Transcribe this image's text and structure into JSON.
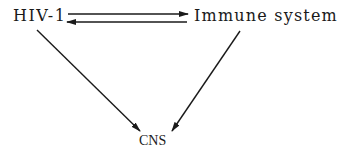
{
  "diagram": {
    "nodes": [
      {
        "id": "hiv",
        "label": "HIV-1"
      },
      {
        "id": "immune",
        "label": "Immune system"
      },
      {
        "id": "cns",
        "label": "CNS"
      }
    ],
    "edges": [
      {
        "from": "HIV-1",
        "to": "Immune system"
      },
      {
        "from": "Immune system",
        "to": "HIV-1"
      },
      {
        "from": "HIV-1",
        "to": "CNS"
      },
      {
        "from": "Immune system",
        "to": "CNS"
      }
    ],
    "colors": {
      "line": "#1a1a1a",
      "background": "#ffffff"
    }
  }
}
